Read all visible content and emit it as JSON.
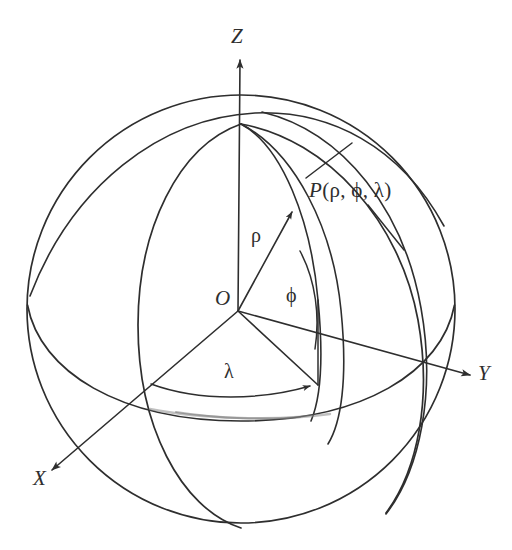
{
  "figure": {
    "name": "spherical-coordinate-system",
    "caption": "",
    "background_color": "#ffffff",
    "stroke_color": "#2e2e2e"
  },
  "labels": {
    "axis_z": "Z",
    "axis_y": "Y",
    "axis_x": "X",
    "origin": "O",
    "radius": "ρ",
    "polar_angle": "ϕ",
    "azimuth_angle": "λ",
    "point_prefix": "P",
    "point_open": "(",
    "point_rho": "ρ",
    "point_comma1": ", ",
    "point_phi": "ϕ",
    "point_comma2": ", ",
    "point_lambda": "λ",
    "point_close": ")",
    "point_full": "P(ρ, ϕ, λ)"
  },
  "geometry": {
    "sphere_center_x": 241,
    "sphere_center_y": 309,
    "sphere_radius": 214,
    "north_pole_x": 241,
    "north_pole_y": 124,
    "south_pole_x": 241,
    "south_pole_y": 528,
    "origin_x": 238,
    "origin_y": 311,
    "point_p_x": 288,
    "point_p_y": 216
  }
}
